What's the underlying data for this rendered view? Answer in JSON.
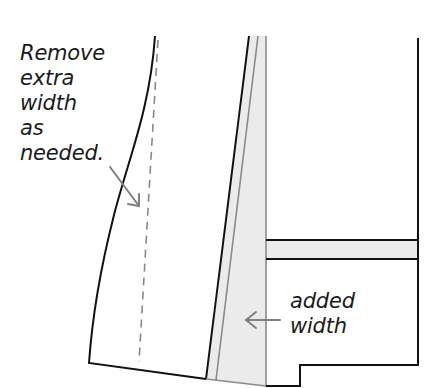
{
  "diagram": {
    "type": "sewing-pattern-adjustment",
    "annotations": {
      "remove_extra_width": {
        "lines": [
          "Remove",
          "extra",
          "width",
          "as",
          "needed."
        ]
      },
      "added_width": {
        "lines": [
          "added",
          "width"
        ]
      }
    },
    "pieces": [
      {
        "name": "left-pattern-piece",
        "cut_line": "dashed",
        "note": "Remove extra width as needed."
      },
      {
        "name": "middle-added-width-strip",
        "fill": "#ebebeb",
        "note": "added width"
      },
      {
        "name": "right-pattern-piece",
        "band": "horizontal shaded band"
      }
    ],
    "colors": {
      "outline": "#111111",
      "guide_line": "#8a8a8a",
      "shading": "#ebebeb",
      "arrow": "#808080"
    }
  }
}
